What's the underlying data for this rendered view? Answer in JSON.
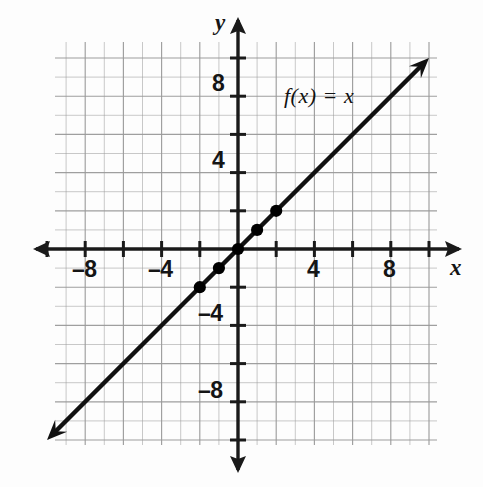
{
  "figure": {
    "background_color": "#fdfdfd",
    "grid_color": "#9a9a9a",
    "axis_color": "#1a1a1a",
    "curve_color": "#111111",
    "point_color": "#000000"
  },
  "labels": {
    "x_axis_name": "x",
    "y_axis_name": "y",
    "function_label": "f(x) = x"
  },
  "chart_data": {
    "type": "line",
    "title": "",
    "subtitle": "",
    "xlabel": "x",
    "ylabel": "y",
    "equation": "f(x) = x",
    "function_label": "f(x) = x",
    "slope": 1,
    "intercept": 0,
    "xlim": [
      -10,
      10
    ],
    "ylim": [
      -10,
      10
    ],
    "grid": true,
    "grid_step": 1,
    "tick_step": 2,
    "legend": "none",
    "arrows": [
      "both-ends-of-line",
      "both-ends-of-x-axis",
      "both-ends-of-y-axis"
    ],
    "x_tick_values": [
      -10,
      -8,
      -6,
      -4,
      -2,
      2,
      4,
      6,
      8,
      10
    ],
    "x_tick_labels": [
      "",
      "–8",
      "",
      "–4",
      "",
      "",
      "4",
      "",
      "8",
      ""
    ],
    "y_tick_values": [
      -10,
      -8,
      -6,
      -4,
      -2,
      2,
      4,
      6,
      8,
      10
    ],
    "y_tick_labels": [
      "",
      "–8",
      "",
      "–4",
      "",
      "",
      "4",
      "",
      "8",
      ""
    ],
    "visible_tick_labels": {
      "x": [
        "–8",
        "–4",
        "4",
        "8"
      ],
      "y": [
        "8",
        "4",
        "–4",
        "–8"
      ]
    },
    "line_endpoints": {
      "x": [
        -10,
        10
      ],
      "y": [
        -10,
        10
      ]
    },
    "marked_points": [
      {
        "x": -2,
        "y": -2
      },
      {
        "x": -1,
        "y": -1
      },
      {
        "x": 0,
        "y": 0
      },
      {
        "x": 1,
        "y": 1
      },
      {
        "x": 2,
        "y": 2
      }
    ],
    "series": [
      {
        "name": "f(x) = x",
        "x": [
          -10,
          -2,
          -1,
          0,
          1,
          2,
          10
        ],
        "values": [
          -10,
          -2,
          -1,
          0,
          1,
          2,
          10
        ]
      }
    ]
  },
  "geometry": {
    "origin_px": {
      "x": 238,
      "y": 249
    },
    "unit_px": 19.1,
    "grid_left_px": 55,
    "grid_top_px": 42,
    "grid_right_px": 437,
    "grid_bottom_px": 445
  },
  "tick_label_positions": {
    "x": [
      {
        "text": "–8",
        "left": 72,
        "top": 256
      },
      {
        "text": "–4",
        "left": 148,
        "top": 256
      },
      {
        "text": "4",
        "left": 307,
        "top": 256
      },
      {
        "text": "8",
        "left": 383,
        "top": 256
      }
    ],
    "y": [
      {
        "text": "8",
        "left": 212,
        "top": 70
      },
      {
        "text": "4",
        "left": 212,
        "top": 147
      },
      {
        "text": "–4",
        "left": 198,
        "top": 300
      },
      {
        "text": "–8",
        "left": 198,
        "top": 377
      }
    ]
  }
}
